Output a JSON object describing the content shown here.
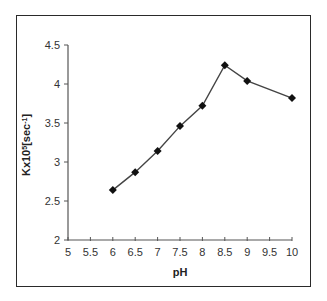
{
  "chart_data": {
    "type": "line",
    "title": "",
    "xlabel": "pH",
    "ylabel": "Kx10⁵[sec⁻¹]",
    "ylabel_parts": {
      "base": "Kx10",
      "sup1": "5",
      "mid": "[sec",
      "sup2": "-1",
      "end": "]"
    },
    "x": [
      6,
      6.5,
      7,
      7.5,
      8,
      8.5,
      9,
      10
    ],
    "values": [
      2.64,
      2.87,
      3.14,
      3.46,
      3.72,
      4.24,
      4.04,
      3.82
    ],
    "xlim": [
      5,
      10
    ],
    "ylim": [
      2,
      4.5
    ],
    "xticks": [
      "5",
      "5.5",
      "6",
      "6.5",
      "7",
      "7.5",
      "8",
      "8.5",
      "9",
      "9.5",
      "10"
    ],
    "yticks": [
      "2",
      "2.5",
      "3",
      "3.5",
      "4",
      "4.5"
    ],
    "grid": false,
    "legend": null,
    "marker": "diamond",
    "line_color": "#444444",
    "marker_color": "#111111"
  }
}
